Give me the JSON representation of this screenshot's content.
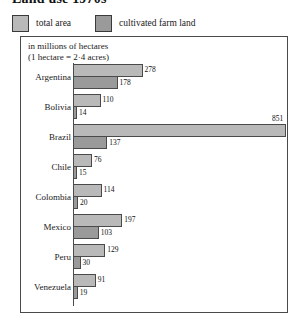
{
  "title": "Land use 1970s",
  "legend": {
    "items": [
      {
        "label": "total area",
        "color": "#b9b9b9",
        "icon": "legend-swatch-total-area"
      },
      {
        "label": "cultivated farm land",
        "color": "#9a9a9a",
        "icon": "legend-swatch-cultivated-farm-land"
      }
    ]
  },
  "units_note_line1": "in millions of hectares",
  "units_note_line2": "(1 hectare = 2·4 acres)",
  "chart_data": {
    "type": "bar",
    "title": "Land use 1970s",
    "subtitle": "in millions of hectares (1 hectare = 2·4 acres)",
    "orientation": "horizontal",
    "grid": false,
    "legend_position": "top-outside",
    "xlabel": "millions of hectares",
    "ylabel": "",
    "xlim": [
      0,
      851
    ],
    "categories": [
      "Argentina",
      "Bolivia",
      "Brazil",
      "Chile",
      "Colombia",
      "Mexico",
      "Peru",
      "Venezuela"
    ],
    "series": [
      {
        "name": "total area",
        "color": "#b9b9b9",
        "values": [
          278,
          110,
          851,
          76,
          114,
          197,
          129,
          91
        ]
      },
      {
        "name": "cultivated farm land",
        "color": "#9a9a9a",
        "values": [
          178,
          14,
          137,
          15,
          20,
          103,
          30,
          19
        ]
      }
    ],
    "rows": [
      {
        "country": "Argentina",
        "total": 278,
        "total_label": "278",
        "farm": 178,
        "farm_label": "178"
      },
      {
        "country": "Bolivia",
        "total": 110,
        "total_label": "110",
        "farm": 14,
        "farm_label": "14"
      },
      {
        "country": "Brazil",
        "total": 851,
        "total_label": "851",
        "farm": 137,
        "farm_label": "137"
      },
      {
        "country": "Chile",
        "total": 76,
        "total_label": "76",
        "farm": 15,
        "farm_label": "15"
      },
      {
        "country": "Colombia",
        "total": 114,
        "total_label": "114",
        "farm": 20,
        "farm_label": "20"
      },
      {
        "country": "Mexico",
        "total": 197,
        "total_label": "197",
        "farm": 103,
        "farm_label": "103"
      },
      {
        "country": "Peru",
        "total": 129,
        "total_label": "129",
        "farm": 30,
        "farm_label": "30"
      },
      {
        "country": "Venezuela",
        "total": 91,
        "total_label": "91",
        "farm": 19,
        "farm_label": "19"
      }
    ]
  }
}
